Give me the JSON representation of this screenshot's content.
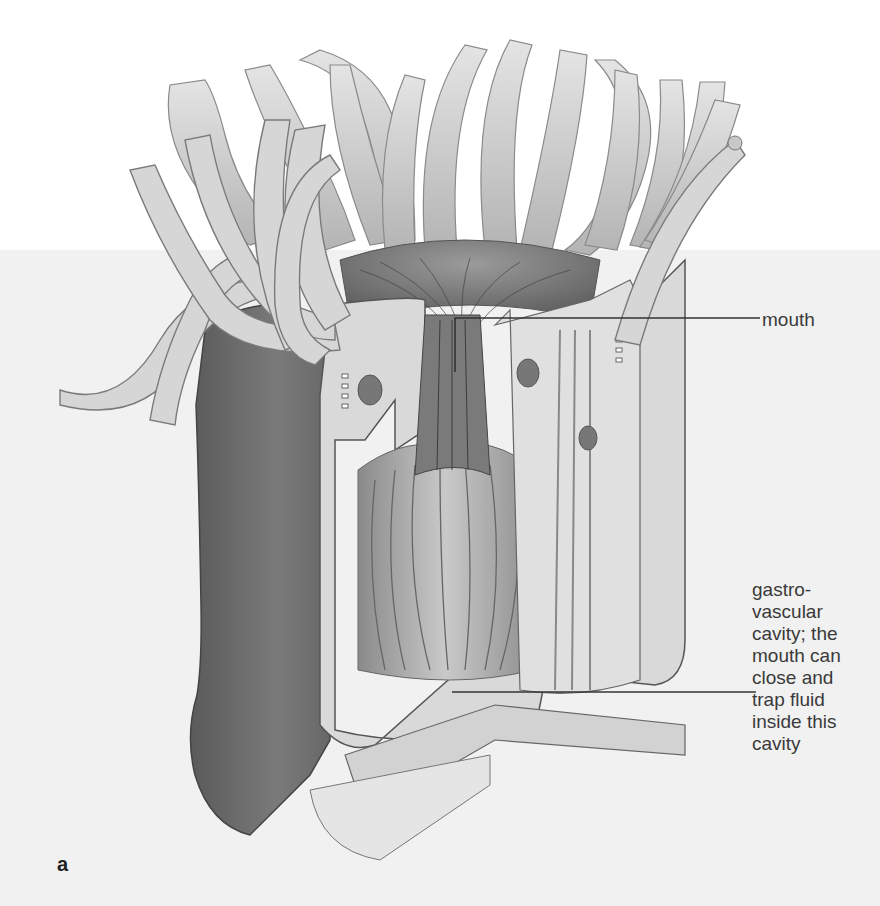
{
  "figure": {
    "panel_letter": "a",
    "background": {
      "top_color": "#ffffff",
      "bottom_color": "#f1f1f1",
      "split_y": 250
    }
  },
  "labels": {
    "mouth": "mouth",
    "gastrovascular_lines": [
      "gastro-",
      "vascular",
      "cavity; the",
      "mouth can",
      "close and",
      "trap fluid",
      "inside this",
      "cavity"
    ]
  },
  "colors": {
    "leader_line": "#333333",
    "label_text": "#3a3a3a",
    "tentacle_fill": "#cfcfcf",
    "body_dark": "#6e6e6e",
    "tissue_light": "#e2e2e2",
    "cavity_mid": "#9a9a9a"
  }
}
